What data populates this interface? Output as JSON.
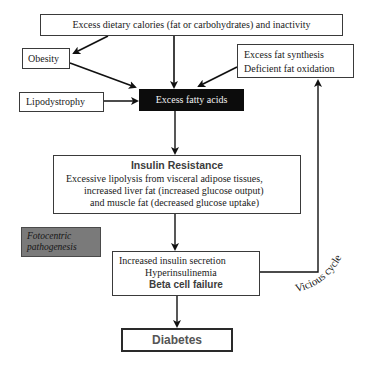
{
  "diagram": {
    "nodes": {
      "dietary": {
        "label": "Excess dietary calories (fat or carbohydrates) and inactivity"
      },
      "obesity": {
        "label": "Obesity"
      },
      "fat_synthesis": {
        "lines": [
          "Excess fat synthesis",
          "Deficient fat oxidation"
        ]
      },
      "lipodystrophy": {
        "label": "Lipodystrophy"
      },
      "fatty_acids": {
        "label": "Excess fatty acids"
      },
      "insulin_resistance": {
        "title": "Insulin Resistance",
        "lines": [
          "Excessive lipolysis from visceral adipose tissues,",
          "increased liver fat (increased glucose output)",
          "and muscle fat (decreased glucose uptake)"
        ]
      },
      "fotocentric": {
        "lines": [
          "Fotocentric",
          "pathogenesis"
        ]
      },
      "beta_cell": {
        "lines": [
          "Increased insulin secretion",
          "Hyperinsulinemia"
        ],
        "emphasis": "Beta cell failure"
      },
      "diabetes": {
        "label": "Diabetes"
      }
    },
    "annotations": {
      "vicious_cycle": "Vicious cycle"
    },
    "edges": [
      {
        "from": "dietary",
        "to": "obesity"
      },
      {
        "from": "dietary",
        "to": "fatty_acids"
      },
      {
        "from": "obesity",
        "to": "fatty_acids"
      },
      {
        "from": "fat_synthesis",
        "to": "fatty_acids"
      },
      {
        "from": "lipodystrophy",
        "to": "fatty_acids"
      },
      {
        "from": "fatty_acids",
        "to": "insulin_resistance"
      },
      {
        "from": "insulin_resistance",
        "to": "beta_cell"
      },
      {
        "from": "beta_cell",
        "to": "diabetes"
      },
      {
        "from": "beta_cell",
        "to": "fat_synthesis",
        "label": "Vicious cycle"
      }
    ],
    "colors": {
      "black_box": "#0c0c0c",
      "gray_box": "#7a7a7a",
      "line": "#1a1a1a"
    }
  }
}
